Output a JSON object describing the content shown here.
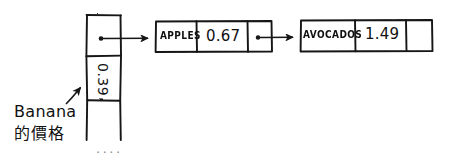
{
  "diagram": {
    "type": "hash-table-with-chained-linked-list",
    "style": "hand-drawn sketch, black ink on white",
    "ink_color": "#141414",
    "background_color": "#ffffff",
    "bucket_array": {
      "label": "hash table bucket column",
      "slots": [
        {
          "name": "slot-pointer",
          "content": "",
          "has_pointer_dot": true
        },
        {
          "name": "slot-value",
          "content": "0.39",
          "rotated": true
        },
        {
          "name": "slot-empty",
          "content": ""
        }
      ],
      "continuation": "...."
    },
    "nodes": [
      {
        "name": "node-apples",
        "key": "APPLES",
        "value": "0.67",
        "next": "pointer",
        "has_pointer_dot": true
      },
      {
        "name": "node-avocados",
        "key": "AVOCADOS",
        "value": "1.49",
        "next": "",
        "has_pointer_dot": false
      }
    ],
    "annotation": {
      "line1": "Banana",
      "line2": "的價格",
      "points_to": "0.39",
      "arrow": "up-right"
    },
    "arrows": [
      {
        "name": "arrow-bucket-to-apples",
        "from": "bucket slot pointer",
        "to": "node-apples"
      },
      {
        "name": "arrow-apples-to-avocados",
        "from": "node-apples next",
        "to": "node-avocados"
      }
    ]
  }
}
